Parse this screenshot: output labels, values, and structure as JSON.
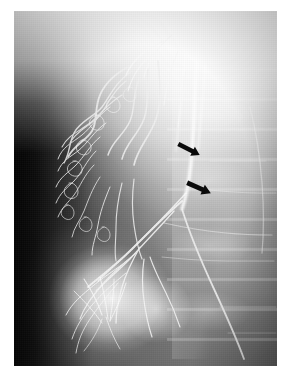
{
  "figure": {
    "kind": "radiograph",
    "modality_label": "angiogram",
    "frame": {
      "x": 14,
      "y": 11,
      "width": 263,
      "height": 355
    },
    "page_background": "#ffffff",
    "film_background": "#2a2a2a"
  },
  "annotations": [
    {
      "id": "arrow-upper",
      "name": "annotation-arrow-upper",
      "glyph": "solid-arrow",
      "direction": "down-right",
      "color": "#0a0a0a",
      "x": 176,
      "y": 141,
      "width": 26,
      "height": 17,
      "angle_deg": 27
    },
    {
      "id": "arrow-lower",
      "name": "annotation-arrow-lower",
      "glyph": "solid-arrow",
      "direction": "down-right",
      "color": "#0a0a0a",
      "x": 185,
      "y": 179,
      "width": 28,
      "height": 18,
      "angle_deg": 24
    }
  ],
  "regions": [
    {
      "name": "collateral-vessel-plexus",
      "description": "dense tortuous collateral vessels, left hemifield"
    },
    {
      "name": "superior-overexposed-band",
      "description": "bright overexposed superior region"
    },
    {
      "name": "vertical-catheter-vessel",
      "description": "bright vertical opacified vessel running superiorly"
    },
    {
      "name": "vertebral-column",
      "description": "vertebral bodies with endplate lines, right hemifield"
    },
    {
      "name": "rounded-organ-opacity",
      "description": "bright rounded organ opacity, inferior-left"
    },
    {
      "name": "hilar-convergence",
      "description": "vessels converging toward hilum, mid field"
    },
    {
      "name": "dark-background-gutter",
      "description": "dark unexposed field along left margin"
    }
  ]
}
